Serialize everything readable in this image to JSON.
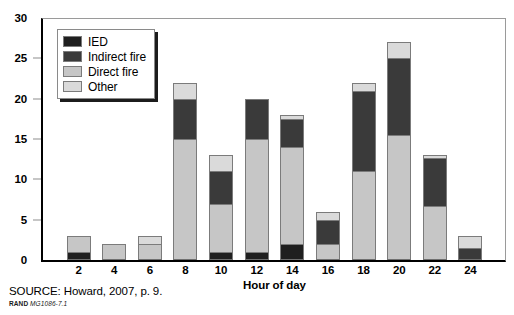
{
  "chart_data": {
    "type": "bar",
    "subtype": "stacked-vertical",
    "title": "",
    "xlabel": "Hour of day",
    "ylabel": "",
    "categories": [
      "2",
      "4",
      "6",
      "8",
      "10",
      "12",
      "14",
      "16",
      "18",
      "20",
      "22",
      "24"
    ],
    "series": [
      {
        "name": "IED",
        "color": "#1f1f1f",
        "values": [
          1.0,
          0.0,
          0.0,
          0.0,
          1.0,
          1.0,
          2.0,
          0.0,
          0.0,
          0.0,
          0.0,
          0.0
        ]
      },
      {
        "name": "Direct fire",
        "color": "#c6c6c6",
        "values": [
          2.0,
          2.0,
          2.0,
          15.0,
          6.0,
          14.0,
          12.0,
          2.0,
          11.0,
          15.5,
          6.7,
          0.0
        ]
      },
      {
        "name": "Indirect fire",
        "color": "#3a3a3a",
        "values": [
          0.0,
          0.0,
          0.0,
          5.0,
          4.0,
          5.0,
          3.5,
          3.0,
          10.0,
          9.5,
          6.0,
          1.5
        ]
      },
      {
        "name": "Other",
        "color": "#dadada",
        "values": [
          0.0,
          0.0,
          1.0,
          2.0,
          2.0,
          0.0,
          0.5,
          1.0,
          1.0,
          2.0,
          0.3,
          1.5
        ]
      }
    ],
    "stack_order_bottom_to_top": [
      "IED",
      "Direct fire",
      "Indirect fire",
      "Other"
    ],
    "totals": [
      3,
      2,
      3,
      22,
      13,
      20,
      18,
      6,
      22,
      27,
      13,
      3
    ],
    "ylim": [
      0,
      30
    ],
    "yticks": [
      0,
      5,
      10,
      15,
      20,
      25,
      30
    ],
    "ytick_labels": [
      "0",
      "5",
      "10",
      "15",
      "20",
      "25",
      "30"
    ],
    "xtick_labels": [
      "2",
      "4",
      "6",
      "8",
      "10",
      "12",
      "14",
      "16",
      "18",
      "20",
      "22",
      "24"
    ],
    "grid": false,
    "legend_position": "upper-left-inside",
    "legend_entries": [
      "IED",
      "Indirect fire",
      "Direct fire",
      "Other"
    ]
  },
  "legend": {
    "items": [
      {
        "label": "IED",
        "color": "#1f1f1f"
      },
      {
        "label": "Indirect fire",
        "color": "#3a3a3a"
      },
      {
        "label": "Direct fire",
        "color": "#c6c6c6"
      },
      {
        "label": "Other",
        "color": "#dadada"
      }
    ]
  },
  "axes": {
    "x_title": "Hour of day",
    "y_ticks": [
      "30",
      "25",
      "20",
      "15",
      "10",
      "5",
      "0"
    ],
    "x_ticks": [
      "2",
      "4",
      "6",
      "8",
      "10",
      "12",
      "14",
      "16",
      "18",
      "20",
      "22",
      "24"
    ]
  },
  "footer": {
    "source": "SOURCE: Howard, 2007, p. 9.",
    "rand_word": "RAND",
    "rand_number": "MG1086-7.1"
  },
  "colors": {
    "ied": "#1f1f1f",
    "indirect_fire": "#3a3a3a",
    "direct_fire": "#c6c6c6",
    "other": "#dadada",
    "axis": "#000000",
    "frame": "#9a9a9a"
  }
}
